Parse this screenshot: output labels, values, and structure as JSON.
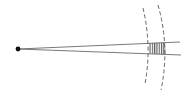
{
  "diagram": {
    "title": "",
    "colors": {
      "background": "#ffffff",
      "line": "#6a6a6a",
      "dot": "#111111",
      "dashed_arc": "#555555",
      "hatch": "#444444"
    },
    "source_point": {
      "x": 18,
      "y": 49,
      "r": 2.4
    },
    "rays": [
      {
        "name": "upper-ray",
        "x1": 18,
        "y1": 49,
        "x2": 180,
        "y2": 42
      },
      {
        "name": "lower-ray",
        "x1": 18,
        "y1": 49,
        "x2": 181,
        "y2": 55
      }
    ],
    "arcs": [
      {
        "name": "inner-arc",
        "path": "M143,8 Q152,46 145,84"
      },
      {
        "name": "outer-arc",
        "path": "M158,5 Q170,47 161,90"
      }
    ],
    "hatched_region": {
      "path": "M149,43 L165,42.5 L166,54.5 L149,53.5 Z",
      "hatch_lines": 7
    }
  }
}
